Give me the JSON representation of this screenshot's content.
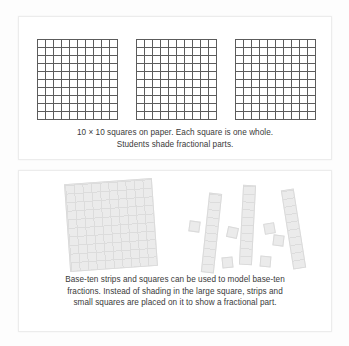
{
  "figure": {
    "background_color": "#fdfdfd",
    "panel_background": "#ffffff",
    "panel_border_color": "#ececec"
  },
  "top_panel": {
    "name": "paper-grids-panel",
    "caption_line_1": "10 × 10 squares on paper. Each square is one whole.",
    "caption_line_2": "Students shade fractional parts.",
    "grid_line_color": "#5c5c5c",
    "grids": [
      {
        "label": "10 x 10 grid 1",
        "rows": 10,
        "cols": 10,
        "shaded_cells": 0
      },
      {
        "label": "10 x 10 grid 2",
        "rows": 10,
        "cols": 10,
        "shaded_cells": 0
      },
      {
        "label": "10 x 10 grid 3",
        "rows": 10,
        "cols": 10,
        "shaded_cells": 0
      }
    ]
  },
  "bottom_panel": {
    "name": "base-ten-manipulatives-panel",
    "caption_line_1": "Base-ten strips and squares can be used to model base-ten",
    "caption_line_2": "fractions. Instead of shading in the large square, strips and",
    "caption_line_3": "small squares are placed on it to show a fractional part.",
    "piece_fill_color": "#ebebeb",
    "piece_line_color": "#dcdcdc",
    "pieces": {
      "large_square": {
        "label": "base-ten hundred square",
        "rows": 10,
        "cols": 10,
        "count": 1
      },
      "strips": {
        "label": "base-ten ten strip",
        "units": 10,
        "count": 3
      },
      "unit_squares": {
        "label": "base-ten unit square",
        "units": 1,
        "count": 6
      }
    }
  }
}
